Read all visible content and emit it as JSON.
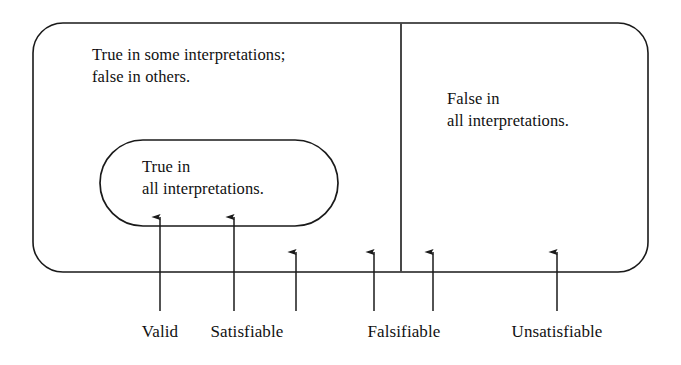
{
  "diagram": {
    "background_color": "#ffffff",
    "stroke_color": "#1a1a1a",
    "text_color": "#111111",
    "regions": [
      {
        "name": "outer-region",
        "shape": "rounded-rectangle",
        "label": "True in some interpretations;\nfalse in others."
      },
      {
        "name": "inner-region",
        "shape": "stadium",
        "label": "True in\nall interpretations."
      },
      {
        "name": "right-region",
        "shape": "rectangle-section",
        "label": "False in\nall interpretations."
      }
    ],
    "divider": {
      "name": "vertical-divider",
      "x": 401,
      "y_top": 23,
      "y_bottom": 272
    },
    "arrows": [
      {
        "name": "arrow-valid-1",
        "x": 160,
        "tip_y": 217,
        "tail_y": 311,
        "points_to": "inner-region"
      },
      {
        "name": "arrow-valid-2",
        "x": 234,
        "tip_y": 217,
        "tail_y": 311,
        "points_to": "inner-region"
      },
      {
        "name": "arrow-satisfiable",
        "x": 296,
        "tip_y": 252,
        "tail_y": 311,
        "points_to": "outer-region"
      },
      {
        "name": "arrow-falsifiable-1",
        "x": 374,
        "tip_y": 252,
        "tail_y": 311,
        "points_to": "outer-region"
      },
      {
        "name": "arrow-falsifiable-2",
        "x": 433,
        "tip_y": 252,
        "tail_y": 311,
        "points_to": "right-region"
      },
      {
        "name": "arrow-unsatisfiable",
        "x": 557,
        "tip_y": 252,
        "tail_y": 311,
        "points_to": "right-region"
      }
    ],
    "axis_labels": [
      {
        "name": "label-valid",
        "text": "Valid",
        "x": 160,
        "y": 322
      },
      {
        "name": "label-satisfiable",
        "text": "Satisfiable",
        "x": 247,
        "y": 322
      },
      {
        "name": "label-falsifiable",
        "text": "Falsifiable",
        "x": 404,
        "y": 322
      },
      {
        "name": "label-unsatisfiable",
        "text": "Unsatisfiable",
        "x": 557,
        "y": 322
      }
    ]
  }
}
